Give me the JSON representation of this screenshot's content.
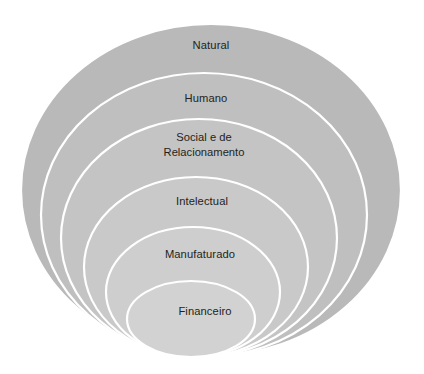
{
  "diagram": {
    "type": "nested-ellipse",
    "background_color": "#ffffff",
    "stroke_color": "#ffffff",
    "label_color": "#231f20",
    "rings": [
      {
        "id": "natural",
        "label": "Natural",
        "label_lines": [
          "Natural"
        ],
        "level": 1,
        "fill": "#b9b9b9",
        "cx": 211,
        "cy": 190,
        "rx": 190,
        "ry": 166,
        "label_x": 211,
        "label_y": 46
      },
      {
        "id": "humano",
        "label": "Humano",
        "label_lines": [
          "Humano"
        ],
        "level": 2,
        "fill": "#bfbfbf",
        "cx": 204,
        "cy": 215,
        "rx": 163,
        "ry": 142,
        "label_x": 206,
        "label_y": 99
      },
      {
        "id": "social-e-de-relacionamento",
        "label": "Social e de Relacionamento",
        "label_lines": [
          "Social e de",
          "Relacionamento"
        ],
        "level": 3,
        "fill": "#c4c4c4",
        "cx": 199,
        "cy": 238,
        "rx": 138,
        "ry": 119,
        "label_x": 204,
        "label_y": 139
      },
      {
        "id": "intelectual",
        "label": "Intelectual",
        "label_lines": [
          "Intelectual"
        ],
        "level": 4,
        "fill": "#c9c9c9",
        "cx": 196,
        "cy": 267,
        "rx": 112,
        "ry": 90,
        "label_x": 202,
        "label_y": 202
      },
      {
        "id": "manufaturado",
        "label": "Manufaturado",
        "label_lines": [
          "Manufaturado"
        ],
        "level": 5,
        "fill": "#cecece",
        "cx": 193,
        "cy": 292,
        "rx": 87,
        "ry": 65,
        "label_x": 200,
        "label_y": 255
      },
      {
        "id": "financeiro",
        "label": "Financeiro",
        "label_lines": [
          "Financeiro"
        ],
        "level": 6,
        "fill": "#d2d2d2",
        "cx": 191,
        "cy": 319,
        "rx": 64,
        "ry": 38,
        "label_x": 205,
        "label_y": 312
      }
    ]
  }
}
